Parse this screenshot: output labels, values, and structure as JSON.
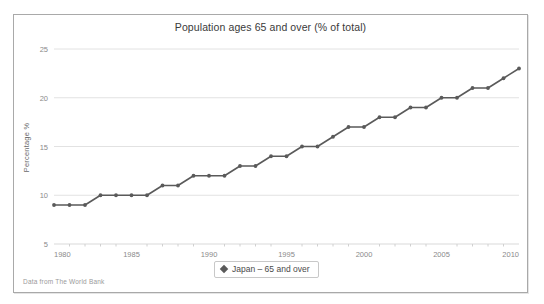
{
  "top_cut_text": "",
  "chart_frame": {
    "source_note": "Data from The World Bank"
  },
  "legend": {
    "marker_icon": "diamond-marker-icon",
    "label": "Japan – 65 and over",
    "position": "bottom-center"
  },
  "chart_data": {
    "type": "line",
    "title": "Population ages 65 and over (% of total)",
    "xlabel": "",
    "ylabel": "Percentage %",
    "xlim": [
      1980,
      2010
    ],
    "ylim": [
      5,
      25
    ],
    "xticks": [
      1980,
      1985,
      1990,
      1995,
      2000,
      2005,
      2010
    ],
    "ytick_labels": [
      "5",
      "10",
      "15",
      "20",
      "25"
    ],
    "yticks": [
      5,
      10,
      15,
      20,
      25
    ],
    "grid": "horizontal",
    "legend_position": "bottom-center",
    "marker": "circle",
    "line_color": "#5a5a5a",
    "marker_color": "#5a5a5a",
    "x": [
      1980,
      1981,
      1982,
      1983,
      1984,
      1985,
      1986,
      1987,
      1988,
      1989,
      1990,
      1991,
      1992,
      1993,
      1994,
      1995,
      1996,
      1997,
      1998,
      1999,
      2000,
      2001,
      2002,
      2003,
      2004,
      2005,
      2006,
      2007,
      2008,
      2009,
      2010
    ],
    "series": [
      {
        "name": "Japan – 65 and over",
        "values": [
          9,
          9,
          9,
          10,
          10,
          10,
          10,
          11,
          11,
          12,
          12,
          12,
          13,
          13,
          14,
          14,
          15,
          15,
          16,
          17,
          17,
          18,
          18,
          19,
          19,
          20,
          20,
          21,
          21,
          22,
          23
        ]
      }
    ]
  }
}
